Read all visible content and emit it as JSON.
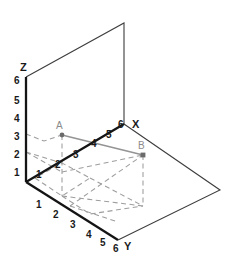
{
  "diagram": {
    "type": "3d-axes-plot",
    "colors": {
      "axis": "#1a1a1a",
      "plane_edge": "#4a4a4a",
      "dashed_guide": "#9a9a9a",
      "connector": "#8c8c8c",
      "point": "#555555",
      "label_text": "#1a1a1a",
      "point_label_text": "#8c8c8c",
      "background": "#ffffff"
    },
    "axes": [
      {
        "name": "z-axis",
        "label": "Z",
        "ticks": [
          "1",
          "2",
          "3",
          "4",
          "5",
          "6"
        ],
        "max": 6,
        "direction": "up"
      },
      {
        "name": "x-axis",
        "label": "X",
        "ticks": [
          "1",
          "2",
          "3",
          "4",
          "5",
          "6"
        ],
        "max": 6,
        "direction": "up-right"
      },
      {
        "name": "y-axis",
        "label": "Y",
        "ticks": [
          "1",
          "2",
          "3",
          "4",
          "5",
          "6"
        ],
        "max": 6,
        "direction": "down-right"
      }
    ],
    "points": [
      {
        "name": "point-a",
        "label": "A",
        "x": 2,
        "y": 0,
        "z": 3
      },
      {
        "name": "point-b",
        "label": "B",
        "x": 6,
        "y": 4,
        "z": 2
      }
    ],
    "connector": {
      "name": "segment-ab",
      "from": "A",
      "to": "B",
      "style": "solid-gray"
    },
    "planes": [
      {
        "name": "xz-plane",
        "style": "outline",
        "description": "vertical back plane"
      },
      {
        "name": "xy-plane",
        "style": "outline",
        "description": "horizontal base plane"
      }
    ],
    "guides": {
      "style": "dashed",
      "description": "projection lines from points A and B to the coordinate planes"
    }
  }
}
